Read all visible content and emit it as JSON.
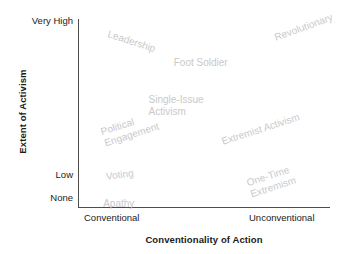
{
  "chart_data": {
    "type": "scatter",
    "title": "",
    "subtitle": "",
    "xlabel": "Conventionality of Action",
    "ylabel": "Extent of Activism",
    "xtick_labels": [
      "Conventional",
      "Unconventional"
    ],
    "ytick_labels": [
      "Very High",
      "Low",
      "None"
    ],
    "xlim": [
      "Conventional",
      "Unconventional"
    ],
    "ylim": [
      "None",
      "Very High"
    ],
    "grid": false,
    "legend": "none",
    "label_color": "#c9c9c9",
    "axis_color": "#4d4d4d",
    "text_color": "#1a1a1a",
    "points": [
      {
        "label": "Leadership",
        "x_pct": 12,
        "y_pct": 95,
        "rotation": 18,
        "lines": [
          "Leadership"
        ]
      },
      {
        "label": "Revolutionary",
        "x_pct": 78,
        "y_pct": 93,
        "rotation": -20,
        "lines": [
          "Revolutionary"
        ]
      },
      {
        "label": "Foot Soldier",
        "x_pct": 38,
        "y_pct": 80,
        "rotation": 0,
        "lines": [
          "Foot Soldier"
        ]
      },
      {
        "label": "Single-Issue Activism",
        "x_pct": 28,
        "y_pct": 60,
        "rotation": 0,
        "lines": [
          "Single-Issue",
          "Activism"
        ]
      },
      {
        "label": "Political Engagement",
        "x_pct": 10,
        "y_pct": 43,
        "rotation": -18,
        "lines": [
          "Political",
          "Engagement"
        ]
      },
      {
        "label": "Extremist Activism",
        "x_pct": 57,
        "y_pct": 38,
        "rotation": -18,
        "lines": [
          "Extremist Activism"
        ]
      },
      {
        "label": "Voting",
        "x_pct": 11,
        "y_pct": 19,
        "rotation": -8,
        "lines": [
          "Voting"
        ]
      },
      {
        "label": "One-Time Extremism",
        "x_pct": 68,
        "y_pct": 16,
        "rotation": -18,
        "lines": [
          "One-Time",
          "Extremism"
        ]
      },
      {
        "label": "Apathy",
        "x_pct": 10,
        "y_pct": 5,
        "rotation": 0,
        "lines": [
          "Apathy"
        ]
      }
    ]
  },
  "axes": {
    "y_title": "Extent of Activism",
    "x_title": "Conventionality of Action",
    "y_ticks": [
      {
        "label": "Very High"
      },
      {
        "label": "Low"
      },
      {
        "label": "None"
      }
    ],
    "x_ticks": [
      {
        "label": "Conventional"
      },
      {
        "label": "Unconventional"
      }
    ]
  },
  "labels": {
    "leadership": "Leadership",
    "revolutionary": "Revolutionary",
    "foot_soldier": "Foot Soldier",
    "single_issue_l1": "Single-Issue",
    "single_issue_l2": "Activism",
    "political_l1": "Political",
    "political_l2": "Engagement",
    "extremist_activism": "Extremist Activism",
    "voting": "Voting",
    "one_time_l1": "One-Time",
    "one_time_l2": "Extremism",
    "apathy": "Apathy"
  }
}
